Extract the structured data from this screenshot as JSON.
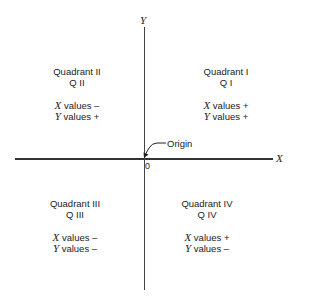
{
  "axes": {
    "x_label": "X",
    "y_label": "Y",
    "origin_value": "0",
    "origin_label": "Origin"
  },
  "quadrants": [
    {
      "name": "Quadrant I",
      "short": "Q I",
      "x_var": "X",
      "x_text": " values +",
      "y_var": "Y",
      "y_text": " values +"
    },
    {
      "name": "Quadrant II",
      "short": "Q II",
      "x_var": "X",
      "x_text": " values –",
      "y_var": "Y",
      "y_text": " values +"
    },
    {
      "name": "Quadrant III",
      "short": "Q III",
      "x_var": "X",
      "x_text": " values –",
      "y_var": "Y",
      "y_text": " values –"
    },
    {
      "name": "Quadrant IV",
      "short": "Q IV",
      "x_var": "X",
      "x_text": " values +",
      "y_var": "Y",
      "y_text": " values –"
    }
  ],
  "colors": {
    "ink": "#222222",
    "background": "#ffffff"
  }
}
